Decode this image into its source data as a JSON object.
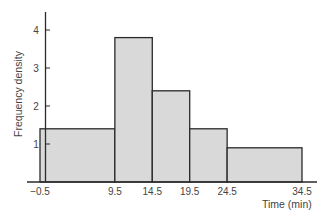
{
  "chart_data": {
    "type": "bar",
    "subtype": "histogram",
    "title": "",
    "xlabel": "Time (min)",
    "ylabel": "Frequency density",
    "bin_edges": [
      -0.5,
      9.5,
      14.5,
      19.5,
      24.5,
      34.5
    ],
    "categories": [
      "-0.5–9.5",
      "9.5–14.5",
      "14.5–19.5",
      "19.5–24.5",
      "24.5–34.5"
    ],
    "values": [
      1.4,
      3.8,
      2.4,
      1.4,
      0.9
    ],
    "x_tick_labels": [
      "−0.5",
      "9.5",
      "14.5",
      "19.5",
      "24.5",
      "34.5"
    ],
    "y_ticks": [
      1,
      2,
      3,
      4
    ],
    "y_tick_labels": [
      "1",
      "2",
      "3",
      "4"
    ],
    "ylim": [
      0,
      4.5
    ],
    "xlim": [
      -0.5,
      34.5
    ],
    "grid": false,
    "legend": null,
    "colors": {
      "bar_fill": "#d9d9d9",
      "bar_edge": "#2a2a2a",
      "axis": "#2a2a2a"
    }
  }
}
